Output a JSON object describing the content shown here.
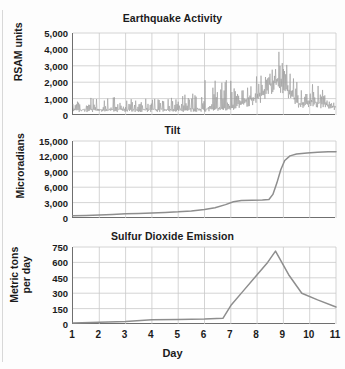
{
  "figure": {
    "xlabel": "Day",
    "panels": [
      "earthquake",
      "tilt",
      "so2"
    ]
  },
  "chart_data": [
    {
      "type": "line",
      "id": "earthquake",
      "title": "Earthquake Activity",
      "ylabel": "RSAM units",
      "xlabel": "",
      "xlim": [
        1,
        11
      ],
      "ylim": [
        0,
        5000
      ],
      "yticks": [
        0,
        1000,
        2000,
        3000,
        4000,
        5000
      ],
      "ytick_labels": [
        "0",
        "1,000",
        "2,000",
        "3,000",
        "4,000",
        "5,000"
      ],
      "xticks": [
        1,
        2,
        3,
        4,
        5,
        6,
        7,
        8,
        9,
        10,
        11
      ],
      "grid": true,
      "series_style": "seismic-noise-envelope",
      "envelope_note": "Dense high-frequency RSAM trace; baseline noise with intermittent spikes, escalating to a broad maximum near day 8.5-9 then declining.",
      "envelope_baseline": [
        {
          "x": 1.0,
          "y": 300
        },
        {
          "x": 2.0,
          "y": 330
        },
        {
          "x": 3.0,
          "y": 320
        },
        {
          "x": 4.0,
          "y": 340
        },
        {
          "x": 5.0,
          "y": 330
        },
        {
          "x": 6.0,
          "y": 360
        },
        {
          "x": 6.8,
          "y": 420
        },
        {
          "x": 7.4,
          "y": 700
        },
        {
          "x": 8.0,
          "y": 1100
        },
        {
          "x": 8.5,
          "y": 1900
        },
        {
          "x": 8.9,
          "y": 2200
        },
        {
          "x": 9.2,
          "y": 1500
        },
        {
          "x": 9.6,
          "y": 700
        },
        {
          "x": 10.2,
          "y": 800
        },
        {
          "x": 11.0,
          "y": 500
        }
      ],
      "envelope_peak": [
        {
          "x": 1.0,
          "y": 900
        },
        {
          "x": 1.6,
          "y": 1300
        },
        {
          "x": 2.0,
          "y": 1000
        },
        {
          "x": 2.6,
          "y": 1150
        },
        {
          "x": 3.2,
          "y": 900
        },
        {
          "x": 4.0,
          "y": 1450
        },
        {
          "x": 4.6,
          "y": 1000
        },
        {
          "x": 5.2,
          "y": 1250
        },
        {
          "x": 5.8,
          "y": 1500
        },
        {
          "x": 6.2,
          "y": 3100
        },
        {
          "x": 6.6,
          "y": 1700
        },
        {
          "x": 7.0,
          "y": 2700
        },
        {
          "x": 7.3,
          "y": 1900
        },
        {
          "x": 7.7,
          "y": 2300
        },
        {
          "x": 8.1,
          "y": 3300
        },
        {
          "x": 8.4,
          "y": 3700
        },
        {
          "x": 8.7,
          "y": 4050
        },
        {
          "x": 9.0,
          "y": 3600
        },
        {
          "x": 9.3,
          "y": 2500
        },
        {
          "x": 9.7,
          "y": 1500
        },
        {
          "x": 10.3,
          "y": 2000
        },
        {
          "x": 10.7,
          "y": 1800
        },
        {
          "x": 11.0,
          "y": 1200
        }
      ],
      "peak_value": 4050,
      "peak_day": 8.7
    },
    {
      "type": "line",
      "id": "tilt",
      "title": "Tilt",
      "ylabel": "Microradians",
      "xlabel": "",
      "xlim": [
        1,
        11
      ],
      "ylim": [
        0,
        15000
      ],
      "yticks": [
        0,
        3000,
        6000,
        9000,
        12000,
        15000
      ],
      "ytick_labels": [
        "0",
        "3,000",
        "6,000",
        "9,000",
        "12,000",
        "15,000"
      ],
      "xticks": [
        1,
        2,
        3,
        4,
        5,
        6,
        7,
        8,
        9,
        10,
        11
      ],
      "grid": true,
      "points": [
        {
          "x": 1.0,
          "y": 450
        },
        {
          "x": 1.5,
          "y": 500
        },
        {
          "x": 2.0,
          "y": 600
        },
        {
          "x": 2.5,
          "y": 700
        },
        {
          "x": 3.0,
          "y": 820
        },
        {
          "x": 3.5,
          "y": 900
        },
        {
          "x": 4.0,
          "y": 980
        },
        {
          "x": 4.5,
          "y": 1080
        },
        {
          "x": 5.0,
          "y": 1200
        },
        {
          "x": 5.5,
          "y": 1380
        },
        {
          "x": 6.0,
          "y": 1650
        },
        {
          "x": 6.4,
          "y": 2000
        },
        {
          "x": 6.8,
          "y": 2600
        },
        {
          "x": 7.1,
          "y": 3150
        },
        {
          "x": 7.4,
          "y": 3400
        },
        {
          "x": 7.8,
          "y": 3480
        },
        {
          "x": 8.2,
          "y": 3520
        },
        {
          "x": 8.45,
          "y": 3600
        },
        {
          "x": 8.6,
          "y": 4600
        },
        {
          "x": 8.75,
          "y": 6800
        },
        {
          "x": 8.9,
          "y": 9400
        },
        {
          "x": 9.05,
          "y": 11200
        },
        {
          "x": 9.25,
          "y": 12100
        },
        {
          "x": 9.5,
          "y": 12450
        },
        {
          "x": 9.9,
          "y": 12650
        },
        {
          "x": 10.3,
          "y": 12800
        },
        {
          "x": 10.7,
          "y": 12900
        },
        {
          "x": 11.0,
          "y": 12900
        }
      ],
      "plateau_value": 3500,
      "final_value": 12900
    },
    {
      "type": "line",
      "id": "so2",
      "title": "Sulfur Dioxide Emission",
      "ylabel": "Metric tons\nper day",
      "xlabel": "Day",
      "xlim": [
        1,
        11
      ],
      "ylim": [
        0,
        750
      ],
      "yticks": [
        0,
        150,
        300,
        450,
        600,
        750
      ],
      "ytick_labels": [
        "0",
        "150",
        "300",
        "450",
        "600",
        "750"
      ],
      "xticks": [
        1,
        2,
        3,
        4,
        5,
        6,
        7,
        8,
        9,
        10,
        11
      ],
      "grid": true,
      "points": [
        {
          "x": 1.0,
          "y": 10
        },
        {
          "x": 2.0,
          "y": 18
        },
        {
          "x": 3.0,
          "y": 25
        },
        {
          "x": 4.0,
          "y": 42
        },
        {
          "x": 5.0,
          "y": 45
        },
        {
          "x": 6.0,
          "y": 48
        },
        {
          "x": 6.7,
          "y": 55
        },
        {
          "x": 7.0,
          "y": 180
        },
        {
          "x": 7.5,
          "y": 330
        },
        {
          "x": 8.0,
          "y": 480
        },
        {
          "x": 8.4,
          "y": 600
        },
        {
          "x": 8.7,
          "y": 710
        },
        {
          "x": 9.2,
          "y": 480
        },
        {
          "x": 9.7,
          "y": 300
        },
        {
          "x": 10.3,
          "y": 235
        },
        {
          "x": 11.0,
          "y": 165
        }
      ],
      "peak_value": 710,
      "peak_day": 8.7
    }
  ],
  "colors": {
    "trace": "#8e8e8e",
    "axis": "#6f6f6f",
    "grid": "#c9c9c9",
    "text": "#1b1b1b",
    "background": "#fdfdfd"
  }
}
